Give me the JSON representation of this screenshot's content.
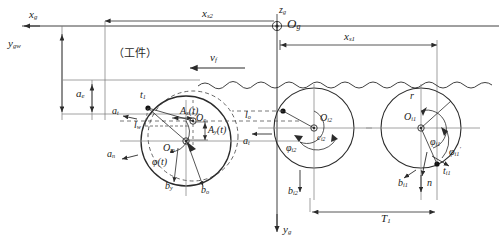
{
  "figure": {
    "type": "engineering-kinematics-diagram",
    "caption_cjk": "（工件）",
    "background": "#ffffff",
    "line_color": "#2b2b2b",
    "dash_color": "#555555"
  },
  "coordinate_system": {
    "x_axis_label": "x",
    "x_axis_sub": "g",
    "y_axis_label": "y",
    "y_axis_sub": "gw",
    "y_bottom_label": "y",
    "y_bottom_sub": "g",
    "z_axis_label": "z",
    "z_axis_sub": "g",
    "origin_label": "O",
    "origin_sub": "g"
  },
  "dimensions": [
    {
      "name": "x_s2",
      "base": "x",
      "sub": "s2",
      "x": 207,
      "y": 12
    },
    {
      "name": "x_s1",
      "base": "x",
      "sub": "s1",
      "x": 348,
      "y": 36
    },
    {
      "name": "a_e",
      "base": "a",
      "sub": "e",
      "x": 80,
      "y": 93
    },
    {
      "name": "T_1",
      "base": "T",
      "sub": "1",
      "x": 385,
      "y": 218
    }
  ],
  "feed": {
    "label_base": "v",
    "label_sub": "f",
    "x": 212,
    "y": 57
  },
  "cutters": [
    {
      "id": "cutter-left",
      "role": "current-position-with-vibration",
      "cx": 186,
      "cy": 141,
      "r": 45,
      "dashed_r": 45,
      "labels": [
        {
          "name": "t1",
          "base": "t",
          "sub": "1",
          "x": 141,
          "y": 93
        },
        {
          "name": "l_w",
          "base": "l",
          "sub": "w",
          "x": 138,
          "y": 124
        },
        {
          "name": "a_t",
          "base": "a",
          "sub": "t",
          "x": 116,
          "y": 115
        },
        {
          "name": "a_n",
          "base": "a",
          "sub": "n",
          "x": 113,
          "y": 155
        },
        {
          "name": "A_x_t",
          "base": "A",
          "sub": "x",
          "suffix": "(t)",
          "x": 189,
          "y": 111
        },
        {
          "name": "A_y_t",
          "base": "A",
          "sub": "y",
          "suffix": "(t)",
          "x": 208,
          "y": 135
        },
        {
          "name": "O_c",
          "base": "O",
          "sub": "c",
          "x": 192,
          "y": 127
        },
        {
          "name": "O_m",
          "base": "O",
          "sub": "m",
          "x": 168,
          "y": 149
        },
        {
          "name": "phi_t",
          "base": "φ",
          "sub": "",
          "suffix": "(t)",
          "x": 161,
          "y": 162
        },
        {
          "name": "b_y",
          "base": "b",
          "sub": "y",
          "x": 170,
          "y": 185
        },
        {
          "name": "b_o",
          "base": "b",
          "sub": "o",
          "x": 199,
          "y": 189
        }
      ]
    },
    {
      "id": "cutter-middle",
      "role": "previous-tooth-position",
      "cx": 314,
      "cy": 128,
      "r": 40,
      "labels": [
        {
          "name": "l_o",
          "base": "l",
          "sub": "o",
          "x": 250,
          "y": 116
        },
        {
          "name": "a_tl",
          "base": "a",
          "sub": "t",
          "x": 249,
          "y": 142
        },
        {
          "name": "O_i2",
          "base": "O",
          "sub": "i2",
          "x": 321,
          "y": 120
        },
        {
          "name": "c_i2",
          "base": "c",
          "sub": "i2",
          "x": 318,
          "y": 138
        },
        {
          "name": "phi_i2",
          "base": "φ",
          "sub": "i2",
          "x": 291,
          "y": 147
        },
        {
          "name": "b_i2",
          "base": "b",
          "sub": "i2",
          "x": 295,
          "y": 190
        }
      ]
    },
    {
      "id": "cutter-right",
      "role": "reference-position",
      "cx": 421,
      "cy": 128,
      "r": 40,
      "labels": [
        {
          "name": "r",
          "base": "r",
          "sub": "",
          "x": 410,
          "y": 95
        },
        {
          "name": "O_i1",
          "base": "O",
          "sub": "i1",
          "x": 412,
          "y": 118
        },
        {
          "name": "phi_i1",
          "base": "φ",
          "sub": "i1",
          "x": 432,
          "y": 142
        },
        {
          "name": "phi_i1p",
          "base": "φ",
          "sub": "i1",
          "prime": true,
          "x": 450,
          "y": 150
        },
        {
          "name": "t_i1",
          "base": "t",
          "sub": "i1",
          "x": 443,
          "y": 172
        },
        {
          "name": "n",
          "base": "n",
          "sub": "",
          "x": 429,
          "y": 183
        },
        {
          "name": "b_i1",
          "base": "b",
          "sub": "i1",
          "x": 405,
          "y": 182
        }
      ]
    }
  ]
}
